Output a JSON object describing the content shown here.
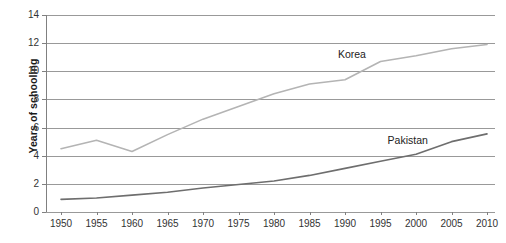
{
  "chart_data": {
    "type": "line",
    "title": "",
    "xlabel": "",
    "ylabel": "Years of schooling",
    "x": [
      1950,
      1955,
      1960,
      1965,
      1970,
      1975,
      1980,
      1985,
      1990,
      1995,
      2000,
      2005,
      2010
    ],
    "xlim": [
      1950,
      2012
    ],
    "ylim": [
      0,
      14
    ],
    "xticks": [
      "1950",
      "1955",
      "1960",
      "1965",
      "1970",
      "1975",
      "1980",
      "1985",
      "1990",
      "1995",
      "2000",
      "2005",
      "2010"
    ],
    "yticks": [
      "0",
      "2",
      "4",
      "6",
      "8",
      "10",
      "12",
      "14"
    ],
    "grid": "horizontal",
    "legend_position": "inline-annotations",
    "series": [
      {
        "name": "Korea",
        "color": "#b4b4b4",
        "label_x": 1989,
        "label_y": 11.2,
        "values": [
          4.5,
          5.1,
          4.3,
          5.5,
          6.6,
          7.5,
          8.4,
          9.1,
          9.4,
          10.7,
          11.1,
          11.6,
          11.9
        ]
      },
      {
        "name": "Pakistan",
        "color": "#6e6e6e",
        "label_x": 1996,
        "label_y": 5.1,
        "values": [
          0.9,
          1.0,
          1.2,
          1.4,
          1.7,
          1.95,
          2.2,
          2.6,
          3.1,
          3.6,
          4.1,
          5.0,
          5.55
        ]
      }
    ]
  },
  "colors": {
    "background": "#ffffff",
    "axis": "#808080",
    "gridline": "#999999",
    "text": "#333333",
    "korea": "#b4b4b4",
    "pakistan": "#6e6e6e"
  }
}
